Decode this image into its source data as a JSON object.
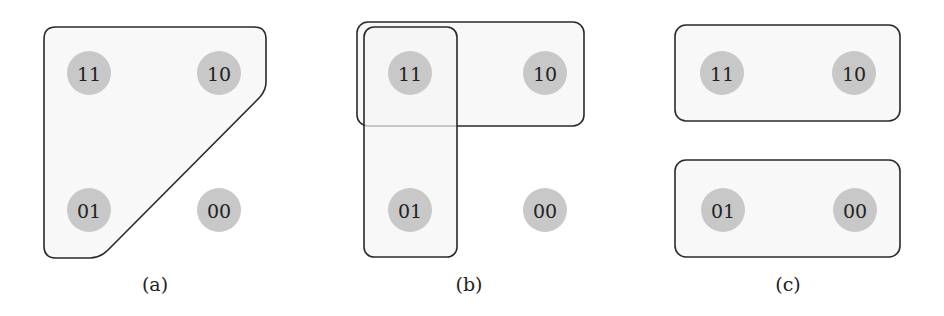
{
  "panels": [
    {
      "caption": "(a)",
      "nodes": [
        {
          "label": "11",
          "cx": 89,
          "cy": 73
        },
        {
          "label": "10",
          "cx": 219,
          "cy": 73
        },
        {
          "label": "01",
          "cx": 89,
          "cy": 210
        },
        {
          "label": "00",
          "cx": 219,
          "cy": 210
        }
      ],
      "groups": [
        {
          "name": "group-11-10-01",
          "members": [
            "11",
            "10",
            "01"
          ]
        }
      ]
    },
    {
      "caption": "(b)",
      "nodes": [
        {
          "label": "11",
          "cx": 410,
          "cy": 73
        },
        {
          "label": "10",
          "cx": 545,
          "cy": 73
        },
        {
          "label": "01",
          "cx": 410,
          "cy": 210
        },
        {
          "label": "00",
          "cx": 545,
          "cy": 210
        }
      ],
      "groups": [
        {
          "name": "group-11-10",
          "members": [
            "11",
            "10"
          ]
        },
        {
          "name": "group-11-01",
          "members": [
            "11",
            "01"
          ]
        }
      ]
    },
    {
      "caption": "(c)",
      "nodes": [
        {
          "label": "11",
          "cx": 722,
          "cy": 73
        },
        {
          "label": "10",
          "cx": 854,
          "cy": 73
        },
        {
          "label": "01",
          "cx": 723,
          "cy": 210
        },
        {
          "label": "00",
          "cx": 855,
          "cy": 210
        }
      ],
      "groups": [
        {
          "name": "group-11-10",
          "members": [
            "11",
            "10"
          ]
        },
        {
          "name": "group-01-00",
          "members": [
            "01",
            "00"
          ]
        }
      ]
    }
  ],
  "colors": {
    "node_fill": "#c8c8c8",
    "group_stroke": "#2a2a2a",
    "group_fill": "#f5f5f5"
  }
}
